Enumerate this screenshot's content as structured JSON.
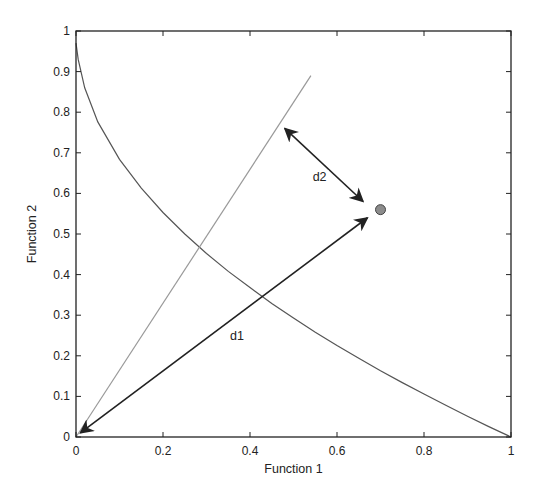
{
  "chart_data": {
    "type": "line",
    "title": "",
    "xlabel": "Function 1",
    "ylabel": "Function 2",
    "xlim": [
      0,
      1
    ],
    "ylim": [
      0,
      1
    ],
    "grid": false,
    "legend": null,
    "xticks": [
      "0",
      "0.2",
      "0.4",
      "0.6",
      "0.8",
      "1"
    ],
    "yticks": [
      "0",
      "0.1",
      "0.2",
      "0.3",
      "0.4",
      "0.5",
      "0.6",
      "0.7",
      "0.8",
      "0.9",
      "1"
    ],
    "series": [
      {
        "name": "pareto-front-curve",
        "color": "#555555",
        "x": [
          0,
          0.005,
          0.02,
          0.05,
          0.1,
          0.15,
          0.2,
          0.25,
          0.3,
          0.35,
          0.4,
          0.45,
          0.5,
          0.55,
          0.6,
          0.65,
          0.7,
          0.75,
          0.8,
          0.85,
          0.9,
          0.95,
          1.0
        ],
        "y": [
          0.97,
          0.93,
          0.86,
          0.776,
          0.684,
          0.613,
          0.553,
          0.5,
          0.452,
          0.408,
          0.368,
          0.329,
          0.293,
          0.258,
          0.225,
          0.194,
          0.163,
          0.134,
          0.106,
          0.078,
          0.051,
          0.025,
          0.0
        ]
      },
      {
        "name": "reference-direction-line",
        "color": "#999999",
        "x": [
          0,
          0.54
        ],
        "y": [
          0,
          0.89
        ]
      }
    ],
    "points": [
      {
        "name": "solution-point",
        "x": 0.7,
        "y": 0.56,
        "fill": "#8c8c8c",
        "stroke": "#444444"
      }
    ],
    "annotations": [
      {
        "label": "d1",
        "type": "double-arrow",
        "from": [
          0.01,
          0.01
        ],
        "to": [
          0.67,
          0.54
        ],
        "label_pos": [
          0.37,
          0.24
        ]
      },
      {
        "label": "d2",
        "type": "double-arrow",
        "from": [
          0.48,
          0.76
        ],
        "to": [
          0.66,
          0.58
        ],
        "label_pos": [
          0.56,
          0.63
        ]
      }
    ]
  },
  "frame": {
    "left": 76,
    "right": 511,
    "top": 31,
    "bottom": 437
  }
}
